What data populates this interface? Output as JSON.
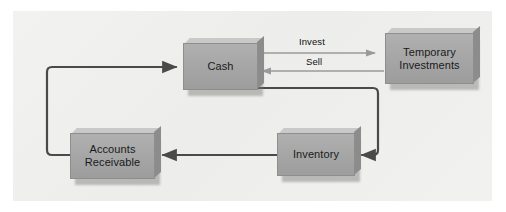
{
  "diagram": {
    "panel_color": "#f0f0ee",
    "node_fill_color": "#a8a8a8",
    "flow_line_color": "#4a4a4a",
    "thin_arrow_color": "#999999",
    "nodes": [
      {
        "id": "cash",
        "label": "Cash"
      },
      {
        "id": "temporary-investments",
        "label": "Temporary\nInvestments"
      },
      {
        "id": "inventory",
        "label": "Inventory"
      },
      {
        "id": "accounts-receivable",
        "label": "Accounts\nReceivable"
      }
    ],
    "edges": [
      {
        "id": "cash-to-temporary-investments",
        "label": "Invest",
        "from": "cash",
        "to": "temporary-investments"
      },
      {
        "id": "temporary-investments-to-cash",
        "label": "Sell",
        "from": "temporary-investments",
        "to": "cash"
      },
      {
        "id": "cash-to-inventory",
        "label": "",
        "from": "cash",
        "to": "inventory"
      },
      {
        "id": "inventory-to-accounts-receivable",
        "label": "",
        "from": "inventory",
        "to": "accounts-receivable"
      },
      {
        "id": "accounts-receivable-to-cash",
        "label": "",
        "from": "accounts-receivable",
        "to": "cash"
      }
    ]
  }
}
